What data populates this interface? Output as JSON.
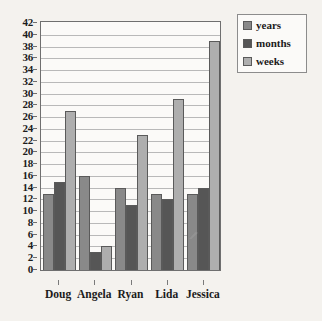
{
  "chart_data": {
    "type": "bar",
    "title": "",
    "xlabel": "",
    "ylabel": "",
    "ylim": [
      0,
      42
    ],
    "ytick_step": 2,
    "grid": true,
    "legend_position": "top-right",
    "categories": [
      "Doug",
      "Angela",
      "Ryan",
      "Lida",
      "Jessica"
    ],
    "series": [
      {
        "name": "years",
        "color": "#898989",
        "values": [
          13,
          16,
          14,
          13,
          13
        ]
      },
      {
        "name": "months",
        "color": "#565656",
        "values": [
          15,
          3,
          11,
          12,
          14
        ]
      },
      {
        "name": "weeks",
        "color": "#aeaeae",
        "values": [
          27,
          4,
          23,
          29,
          39
        ]
      }
    ],
    "yticks": [
      0,
      2,
      4,
      6,
      8,
      10,
      12,
      14,
      16,
      18,
      20,
      22,
      24,
      26,
      28,
      30,
      32,
      34,
      36,
      38,
      40,
      42
    ]
  },
  "legend": {
    "items": [
      {
        "label": "years"
      },
      {
        "label": "months"
      },
      {
        "label": "weeks"
      }
    ]
  },
  "colors": {
    "background": "#f4f2ee",
    "plot_background": "#fbfaf8",
    "axis": "#6f6f6f",
    "gridline": "#b9b9b9",
    "text": "#1b1b1b",
    "series_years": "#898989",
    "series_months": "#565656",
    "series_weeks": "#aeaeae"
  }
}
